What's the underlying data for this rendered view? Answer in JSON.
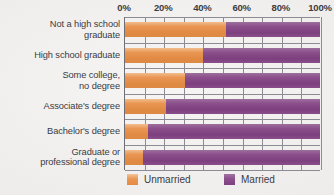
{
  "chart_data": {
    "type": "bar",
    "orientation": "horizontal",
    "stacked": true,
    "stack_total": 100,
    "title": "",
    "subtitle": "",
    "xlabel": "",
    "ylabel": "",
    "xlim": [
      0,
      100
    ],
    "grid": true,
    "grid_step": 10,
    "legend_position": "bottom",
    "categories": [
      "Not a high school graduate",
      "High school graduate",
      "Some college, no degree",
      "Associate's degree",
      "Bachelor's degree",
      "Graduate or professional degree"
    ],
    "category_lines": [
      [
        "Not a high school",
        "graduate"
      ],
      [
        "High school graduate"
      ],
      [
        "Some college,",
        "no degree"
      ],
      [
        "Associate's degree"
      ],
      [
        "Bachelor's degree"
      ],
      [
        "Graduate or",
        "professional degree"
      ]
    ],
    "xtick_labels": [
      "0%",
      "20%",
      "40%",
      "60%",
      "80%",
      "100%"
    ],
    "xtick_values": [
      0,
      20,
      40,
      60,
      80,
      100
    ],
    "series": [
      {
        "name": "Unmarried",
        "color": "#e9964f",
        "values": [
          52,
          40,
          31,
          21,
          12,
          9
        ]
      },
      {
        "name": "Married",
        "color": "#8b4f8c",
        "values": [
          48,
          60,
          69,
          79,
          88,
          91
        ]
      }
    ]
  },
  "legend": {
    "items": [
      {
        "label": "Unmarried",
        "color": "#e9964f"
      },
      {
        "label": "Married",
        "color": "#8b4f8c"
      }
    ]
  }
}
